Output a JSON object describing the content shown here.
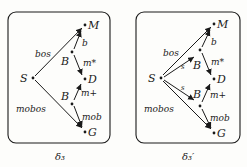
{
  "diagrams": [
    {
      "caption": "δ₃",
      "nodes": {
        "M": "M",
        "B_upper": "B",
        "S": "S",
        "D": "D",
        "B_lower": "B",
        "G": "G"
      },
      "edge_labels": {
        "bos": "bos",
        "b": "b",
        "m_star": "m*",
        "mobos": "mobos",
        "m_plus": "m+",
        "mob": "mob"
      }
    },
    {
      "caption": "δ₃′",
      "nodes": {
        "M": "M",
        "B_upper": "B",
        "S": "S",
        "D": "D",
        "B_lower": "B",
        "G": "G"
      },
      "edge_labels": {
        "bos": "bos",
        "b": "b",
        "m_star": "m*",
        "mobos": "mobos",
        "m_plus": "m+",
        "mob": "mob",
        "s_upper": "s",
        "s_lower": "s"
      }
    }
  ]
}
